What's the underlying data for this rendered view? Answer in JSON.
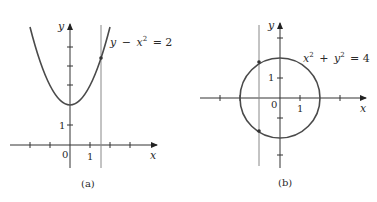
{
  "figures": [
    {
      "id": "a",
      "caption": "(a)",
      "equation": {
        "lhs_y": "y",
        "minus": "−",
        "x": "x",
        "sup": "2",
        "rhs": "= 2"
      },
      "axis_labels": {
        "x": "x",
        "y": "y"
      },
      "tick_labels": {
        "origin": "0",
        "x_one": "1",
        "y_one": "1"
      },
      "curve": "parabola y = x^2 + 2",
      "vertical_line_x": 1.55
    },
    {
      "id": "b",
      "caption": "(b)",
      "equation": {
        "x": "x",
        "sup_x": "2",
        "plus": "+",
        "y": "y",
        "sup_y": "2",
        "rhs": "= 4"
      },
      "axis_labels": {
        "x": "x",
        "y": "y"
      },
      "tick_labels": {
        "origin": "0",
        "x_one": "1",
        "y_one": "1"
      },
      "curve": "circle x^2 + y^2 = 4",
      "vertical_line_x": -1
    }
  ],
  "colors": {
    "curve": "#4a4a4a",
    "axis": "#333333",
    "line": "#888888"
  }
}
